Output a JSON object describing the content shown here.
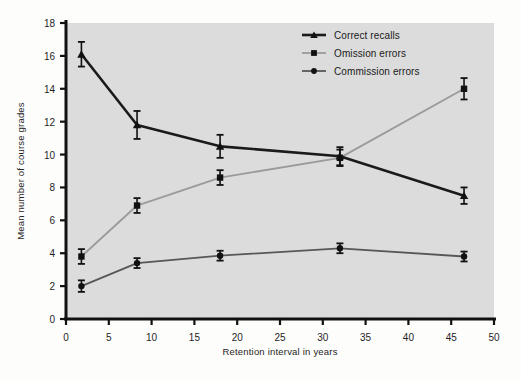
{
  "chart_data": {
    "type": "line",
    "title": "",
    "xlabel": "Retention interval in years",
    "ylabel": "Mean number of course grades",
    "xlim": [
      0,
      50
    ],
    "ylim": [
      0,
      18
    ],
    "xticks": [
      0,
      5,
      10,
      15,
      20,
      25,
      30,
      35,
      40,
      45,
      50
    ],
    "xtick_labels": [
      "0",
      "5",
      "10",
      "15",
      "20",
      "25",
      "30",
      "35",
      "40",
      "45",
      "50"
    ],
    "yticks": [
      0,
      2,
      4,
      6,
      8,
      10,
      12,
      14,
      16,
      18
    ],
    "ytick_labels": [
      "0",
      "2",
      "4",
      "6",
      "8",
      "10",
      "12",
      "14",
      "16",
      "18"
    ],
    "grid": false,
    "legend_position": "top-right",
    "x": [
      1.8,
      8.3,
      18.0,
      32.0,
      46.5
    ],
    "series": [
      {
        "name": "Correct recalls",
        "marker": "triangle",
        "color": "#1a1a1a",
        "line_width": 2.6,
        "values": [
          16.1,
          11.8,
          10.5,
          9.9,
          7.5
        ],
        "errors": [
          0.75,
          0.85,
          0.7,
          0.55,
          0.5
        ]
      },
      {
        "name": "Omission errors",
        "marker": "square",
        "color": "#9a9a9a",
        "line_width": 1.8,
        "values": [
          3.8,
          6.9,
          8.6,
          9.8,
          14.0
        ],
        "errors": [
          0.45,
          0.45,
          0.45,
          0.5,
          0.65
        ]
      },
      {
        "name": "Commission errors",
        "marker": "circle",
        "color": "#575757",
        "line_width": 1.8,
        "values": [
          2.0,
          3.4,
          3.85,
          4.3,
          3.8
        ],
        "errors": [
          0.35,
          0.3,
          0.3,
          0.3,
          0.3
        ]
      }
    ]
  },
  "legend": {
    "entries": [
      {
        "label": "Correct recalls"
      },
      {
        "label": "Omission errors"
      },
      {
        "label": "Commission errors"
      }
    ]
  },
  "colors": {
    "plot_background": "#dcdcdc",
    "page_background": "#fdfdfc",
    "axis": "#111111",
    "correct": "#1a1a1a",
    "omission": "#9a9a9a",
    "commission": "#575757"
  }
}
